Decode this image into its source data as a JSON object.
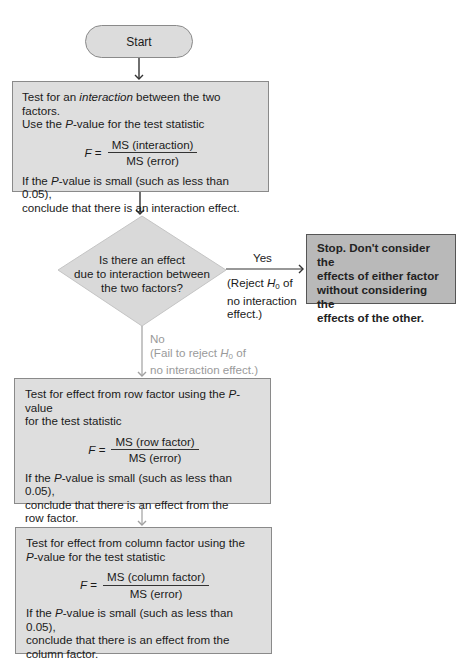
{
  "flowchart": {
    "start": {
      "label": "Start"
    },
    "interaction_test": {
      "line1_pre": "Test for an ",
      "line1_em": "interaction",
      "line1_post": " between the two factors.",
      "line2_pre": "Use the ",
      "line2_em": "P",
      "line2_post": "-value for the test statistic",
      "formula": {
        "lhs": "F",
        "eq": " =",
        "numerator": "MS (interaction)",
        "denominator": "MS (error)"
      },
      "line3_pre": "If the ",
      "line3_em": "P",
      "line3_post": "-value is small (such as less than 0.05),",
      "line4": "conclude that there is an interaction effect."
    },
    "decision": {
      "line1": "Is there an effect",
      "line2": "due to interaction between",
      "line3": "the two factors?"
    },
    "yes_branch": {
      "label": "Yes",
      "note_pre": "(Reject ",
      "note_h": "H",
      "note_sub": "0",
      "note_post": " of",
      "note_line2": "no interaction",
      "note_line3": "effect.)"
    },
    "stop": {
      "line1": "Stop. Don't consider the",
      "line2": "effects of either factor",
      "line3": "without considering the",
      "line4": "effects of the other."
    },
    "no_branch": {
      "label": "No",
      "note_pre": "(Fail to reject ",
      "note_h": "H",
      "note_sub": "0",
      "note_post": " of",
      "note_line2": "no interaction effect.)"
    },
    "row_test": {
      "line1_pre": "Test for effect from row factor using the ",
      "line1_em": "P",
      "line1_post": "-value",
      "line2": "for the test statistic",
      "formula": {
        "lhs": "F",
        "eq": " =",
        "numerator": "MS (row factor)",
        "denominator": "MS (error)"
      },
      "line3_pre": "If the ",
      "line3_em": "P",
      "line3_post": "-value is small (such as less than 0.05),",
      "line4": "conclude that there is an effect from the",
      "line5": "row factor."
    },
    "column_test": {
      "line1": "Test for effect from column factor using the",
      "line2_em": "P",
      "line2_post": "-value for the test statistic",
      "formula": {
        "lhs": "F",
        "eq": " =",
        "numerator": "MS (column factor)",
        "denominator": "MS (error)"
      },
      "line3_pre": "If the ",
      "line3_em": "P",
      "line3_post": "-value is small (such as less than 0.05),",
      "line4": "conclude that there is an effect from the",
      "line5": "column factor."
    }
  },
  "colors": {
    "box_fill": "#dedede",
    "stop_fill": "#b9b9b9",
    "border": "#8a8a8a",
    "no_branch": "#9a9a9a",
    "arrow_dark": "#333333"
  }
}
